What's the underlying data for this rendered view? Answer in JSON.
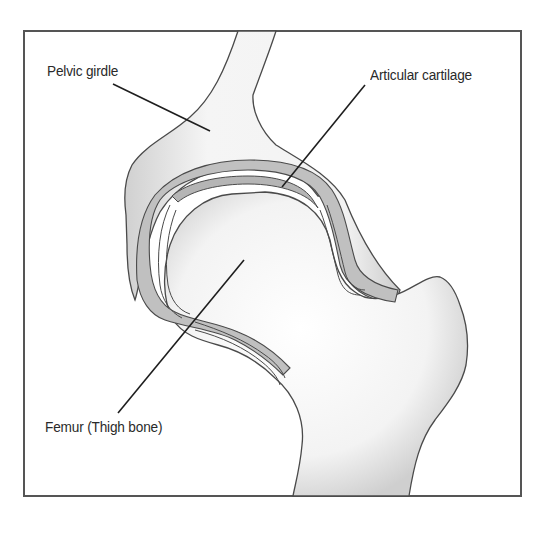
{
  "diagram": {
    "colors": {
      "frame": "#555555",
      "bone_fill": "#f2f2f2",
      "bone_shade": "#c8c8c8",
      "cartilage_fill": "#bdbdbd",
      "outline": "#4a4a4a",
      "leader_line": "#1e1e1e",
      "text": "#2a2a2a"
    },
    "labels": [
      {
        "id": "pelvic-girdle",
        "text": "Pelvic girdle"
      },
      {
        "id": "articular-cartilage",
        "text": "Articular cartilage"
      },
      {
        "id": "femur",
        "text": "Femur (Thigh bone)"
      }
    ]
  }
}
